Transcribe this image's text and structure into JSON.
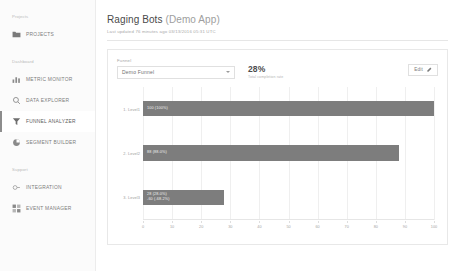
{
  "sidebar": {
    "groups": [
      {
        "label": "Projects",
        "items": [
          {
            "label": "PROJECTS",
            "icon": "folder-icon",
            "name": "projects",
            "active": false
          }
        ]
      },
      {
        "label": "Dashboard",
        "items": [
          {
            "label": "METRIC MONITOR",
            "icon": "bar-chart-icon",
            "name": "metric-monitor",
            "active": false
          },
          {
            "label": "DATA EXPLORER",
            "icon": "search-icon",
            "name": "data-explorer",
            "active": false
          },
          {
            "label": "FUNNEL ANALYZER",
            "icon": "funnel-icon",
            "name": "funnel-analyzer",
            "active": true
          },
          {
            "label": "SEGMENT BUILDER",
            "icon": "segment-icon",
            "name": "segment-builder",
            "active": false
          }
        ]
      },
      {
        "label": "Support",
        "items": [
          {
            "label": "INTEGRATION",
            "icon": "link-icon",
            "name": "integration",
            "active": false
          },
          {
            "label": "EVENT MANAGER",
            "icon": "grid-icon",
            "name": "event-manager",
            "active": false
          }
        ]
      }
    ]
  },
  "header": {
    "title_main": "Raging Bots ",
    "title_dim": "(Demo App)",
    "subtitle": "Last updated 76 minutes ago 03/13/2016 05:31 UTC"
  },
  "funnel": {
    "field_label": "Funnel",
    "selected": "Demo Funnel",
    "options": [
      "Demo Funnel"
    ],
    "percent": "28%",
    "percent_caption": "Total completion rate",
    "edit_label": "Edit"
  },
  "colors": {
    "bar": "#7d7d7d",
    "panel_border": "#e8e8e8",
    "sidebar_bg": "#fbfbfb",
    "grid": "#efefef",
    "active_marker": "#8d8d8d"
  },
  "chart_data": {
    "type": "bar",
    "orientation": "horizontal",
    "title": "",
    "xlabel": "",
    "ylabel": "",
    "xlim": [
      0,
      100
    ],
    "xticks": [
      0,
      10,
      20,
      30,
      40,
      50,
      60,
      70,
      80,
      90,
      100
    ],
    "grid": true,
    "categories": [
      "1. Level1",
      "2. Level2",
      "3. Level3"
    ],
    "values": [
      100,
      88,
      28
    ],
    "bar_labels": [
      "100 (100%)",
      "88 (88.0%)",
      "28 (28.0%)"
    ],
    "bar_sublabels": [
      "",
      "",
      "-60 (-68.2%)"
    ]
  }
}
